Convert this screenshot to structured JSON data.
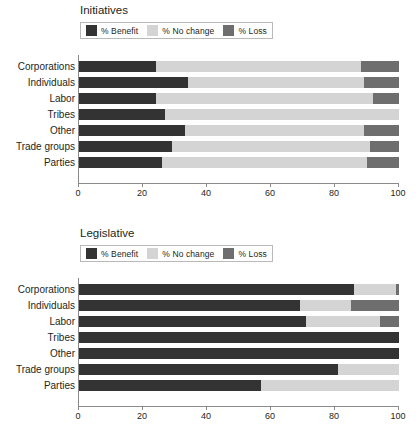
{
  "chart_data": [
    {
      "type": "bar",
      "orientation": "horizontal",
      "stacked": true,
      "title": "Initiatives",
      "xlabel": "",
      "ylabel": "",
      "xlim": [
        0,
        100
      ],
      "xticks": [
        0,
        20,
        40,
        60,
        80,
        100
      ],
      "grid": false,
      "legend_position": "top-left",
      "categories": [
        "Corporations",
        "Individuals",
        "Labor",
        "Tribes",
        "Other",
        "Trade groups",
        "Parties"
      ],
      "series": [
        {
          "name": "% Benefit",
          "color": "#333333",
          "values": [
            24,
            34,
            24,
            27,
            33,
            29,
            26
          ]
        },
        {
          "name": "% No change",
          "color": "#d4d4d4",
          "values": [
            64,
            55,
            68,
            73,
            56,
            62,
            64
          ]
        },
        {
          "name": "% Loss",
          "color": "#6e6e6e",
          "values": [
            12,
            11,
            8,
            0,
            11,
            9,
            10
          ]
        }
      ]
    },
    {
      "type": "bar",
      "orientation": "horizontal",
      "stacked": true,
      "title": "Legislative",
      "xlabel": "",
      "ylabel": "",
      "xlim": [
        0,
        100
      ],
      "xticks": [
        0,
        20,
        40,
        60,
        80,
        100
      ],
      "grid": false,
      "legend_position": "top-left",
      "categories": [
        "Corporations",
        "Individuals",
        "Labor",
        "Tribes",
        "Other",
        "Trade groups",
        "Parties"
      ],
      "series": [
        {
          "name": "% Benefit",
          "color": "#333333",
          "values": [
            86,
            69,
            71,
            100,
            100,
            81,
            57
          ]
        },
        {
          "name": "% No change",
          "color": "#d4d4d4",
          "values": [
            13,
            16,
            23,
            0,
            0,
            19,
            43
          ]
        },
        {
          "name": "% Loss",
          "color": "#6e6e6e",
          "values": [
            1,
            15,
            6,
            0,
            0,
            0,
            0
          ]
        }
      ]
    }
  ],
  "colors": {
    "benefit": "#333333",
    "no_change": "#d4d4d4",
    "loss": "#6e6e6e",
    "axis": "#8a8a8a",
    "text": "#231f20"
  }
}
